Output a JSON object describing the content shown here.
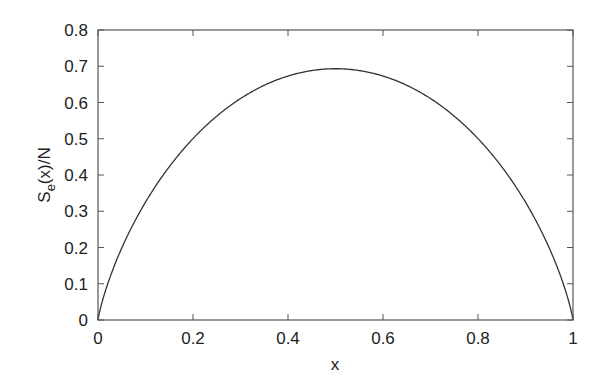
{
  "chart_data": {
    "type": "line",
    "title": "",
    "xlabel": "x",
    "ylabel": "S_e(x)/N",
    "ylabel_main": "S",
    "ylabel_sub": "e",
    "ylabel_rest": "(x)/N",
    "xlim": [
      0,
      1
    ],
    "ylim": [
      0,
      0.8
    ],
    "xticks": [
      "0",
      "0.2",
      "0.4",
      "0.6",
      "0.8",
      "1"
    ],
    "yticks": [
      "0",
      "0.1",
      "0.2",
      "0.3",
      "0.4",
      "0.5",
      "0.6",
      "0.7",
      "0.8"
    ],
    "grid": false,
    "legend": null,
    "series": [
      {
        "name": "S_e(x)/N",
        "x": [
          0,
          0.01,
          0.05,
          0.1,
          0.15,
          0.2,
          0.25,
          0.3,
          0.35,
          0.4,
          0.45,
          0.5,
          0.55,
          0.6,
          0.65,
          0.7,
          0.75,
          0.8,
          0.85,
          0.9,
          0.95,
          0.99,
          1
        ],
        "y": [
          0,
          0.056,
          0.199,
          0.325,
          0.423,
          0.5,
          0.562,
          0.611,
          0.647,
          0.673,
          0.688,
          0.693,
          0.688,
          0.673,
          0.647,
          0.611,
          0.562,
          0.5,
          0.423,
          0.325,
          0.199,
          0.056,
          0
        ]
      }
    ]
  }
}
